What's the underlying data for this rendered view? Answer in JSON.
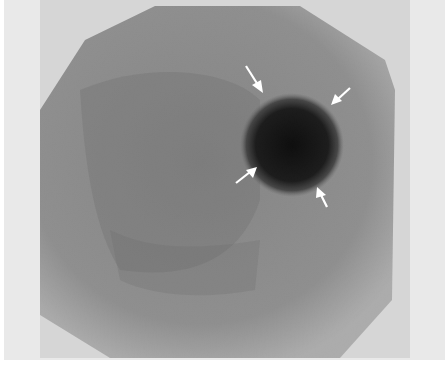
{
  "figure": {
    "type": "nuclear-medicine-scintigram",
    "colors": {
      "outer_frame": "#e9e9e9",
      "inner_panel": "#d6d6d6",
      "field_base": "#8a8a8a",
      "hot_spot": "#141414",
      "arrow": "#ffffff"
    },
    "field": {
      "shape": "octagon",
      "points": "155,6 300,6 385,60 395,90 392,300 340,358 110,358 40,315 40,110 85,40"
    },
    "hot_spot": {
      "cx": 292,
      "cy": 145,
      "r": 48
    },
    "arrows": [
      {
        "name": "arrow-upper-left",
        "tail": [
          246,
          66
        ],
        "head": [
          262,
          92
        ]
      },
      {
        "name": "arrow-upper-right",
        "tail": [
          350,
          88
        ],
        "head": [
          332,
          104
        ]
      },
      {
        "name": "arrow-lower-left",
        "tail": [
          236,
          183
        ],
        "head": [
          256,
          168
        ]
      },
      {
        "name": "arrow-lower-right",
        "tail": [
          327,
          207
        ],
        "head": [
          318,
          188
        ]
      }
    ]
  }
}
